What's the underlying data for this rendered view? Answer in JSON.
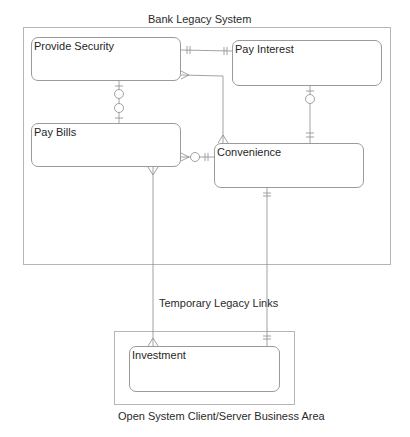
{
  "diagram": {
    "type": "entity-relationship",
    "areas": [
      {
        "id": "legacy",
        "title": "Bank Legacy System"
      },
      {
        "id": "open",
        "title": "Open System Client/Server Business Area"
      }
    ],
    "entities": {
      "provide_security": "Provide Security",
      "pay_interest": "Pay Interest",
      "pay_bills": "Pay Bills",
      "convenience": "Convenience",
      "investment": "Investment"
    },
    "link_label": "Temporary Legacy Links",
    "relationships": [
      {
        "from": "Provide Security",
        "to": "Pay Interest",
        "from_end": "one-and-only-one",
        "to_end": "one-and-only-one"
      },
      {
        "from": "Provide Security",
        "to": "Pay Bills",
        "from_end": "zero-or-one",
        "to_end": "zero-or-one"
      },
      {
        "from": "Provide Security",
        "to": "Convenience",
        "from_end": "many",
        "to_end": "many"
      },
      {
        "from": "Pay Interest",
        "to": "Convenience",
        "from_end": "zero-or-one",
        "to_end": "one-and-only-one"
      },
      {
        "from": "Pay Bills",
        "to": "Convenience",
        "from_end": "zero-or-many",
        "to_end": "one-and-only-one"
      },
      {
        "from": "Pay Bills",
        "to": "Investment",
        "from_end": "many",
        "to_end": "many"
      },
      {
        "from": "Convenience",
        "to": "Investment",
        "from_end": "one-and-only-one",
        "to_end": "one-and-only-one"
      }
    ],
    "colors": {
      "line": "#8a8a8a",
      "border": "#9a9a9a",
      "text": "#222222"
    }
  }
}
